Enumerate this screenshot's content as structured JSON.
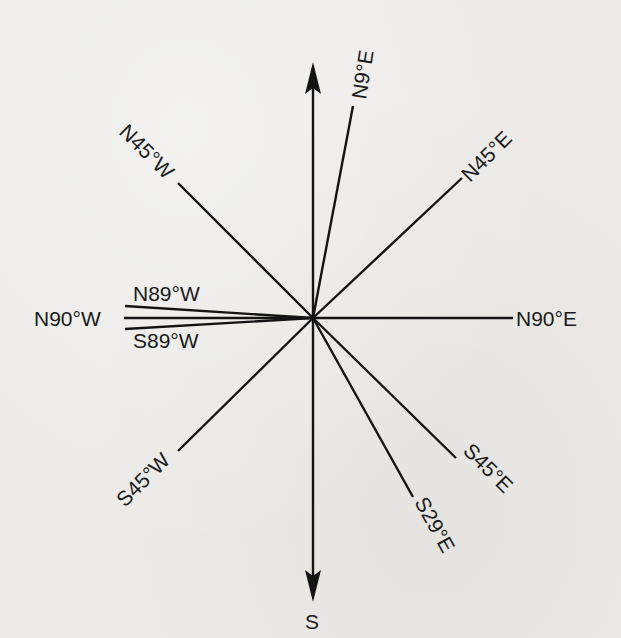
{
  "diagram": {
    "type": "compass-bearings",
    "center": {
      "x": 313,
      "y": 318
    },
    "axis": {
      "north_arrow": true,
      "south_label": "S"
    },
    "bearings": [
      {
        "id": "n9e",
        "label": "N9°E"
      },
      {
        "id": "n45e",
        "label": "N45°E"
      },
      {
        "id": "n90e",
        "label": "N90°E"
      },
      {
        "id": "s45e",
        "label": "S45°E"
      },
      {
        "id": "s29e",
        "label": "S29°E"
      },
      {
        "id": "s45w",
        "label": "S45°W"
      },
      {
        "id": "s89w",
        "label": "S89°W"
      },
      {
        "id": "n90w",
        "label": "N90°W"
      },
      {
        "id": "n89w",
        "label": "N89°W"
      },
      {
        "id": "n45w",
        "label": "N45°W"
      }
    ],
    "colors": {
      "ink": "#141414",
      "paper": "#ecebe8"
    }
  }
}
